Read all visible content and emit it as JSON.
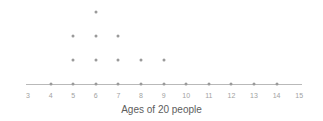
{
  "chart_data": {
    "type": "scatter",
    "plot_style": "dot-plot",
    "title": "Ages of 20 people",
    "xlabel": "",
    "ylabel": "",
    "categories": [
      3,
      4,
      5,
      6,
      7,
      8,
      9,
      10,
      11,
      12,
      13,
      14,
      15
    ],
    "tick_labels": [
      "3",
      "4",
      "5",
      "6",
      "7",
      "8",
      "9",
      "10",
      "11",
      "12",
      "13",
      "14",
      "15"
    ],
    "values": [
      0,
      1,
      3,
      4,
      3,
      2,
      2,
      1,
      1,
      1,
      1,
      1,
      0
    ],
    "total_count": 20,
    "xlim": [
      3,
      15
    ],
    "ylim": [
      0,
      4
    ],
    "grid": false,
    "legend": null,
    "dot_color": "#9a9a9a",
    "axis_color": "#b9b9b9",
    "tick_label_color": "#a2a2a2",
    "title_color": "#5d5d5d",
    "background_color": "#ffffff",
    "annotations": []
  },
  "layout": {
    "axis_y": 84,
    "axis_left": 26,
    "axis_right": 302,
    "first_tick_x": 28,
    "tick_spacing": 22.6,
    "row_spacing": 24,
    "axis_row_y": 84
  }
}
